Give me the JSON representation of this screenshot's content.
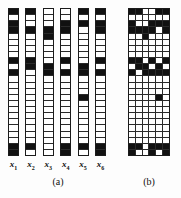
{
  "figure": {
    "panel_a": {
      "caption": "(a)",
      "vectors": [
        {
          "label": "x",
          "subscript": "1",
          "bits": [
            1,
            0,
            1,
            1,
            0,
            0,
            0,
            0,
            1,
            0,
            1,
            0,
            0,
            0,
            0,
            0,
            0,
            0,
            0,
            0,
            0,
            0,
            1,
            1
          ]
        },
        {
          "label": "x",
          "subscript": "2",
          "bits": [
            1,
            0,
            0,
            1,
            0,
            0,
            0,
            0,
            1,
            1,
            0,
            0,
            0,
            0,
            0,
            0,
            0,
            0,
            0,
            0,
            0,
            0,
            1,
            0
          ]
        },
        {
          "label": "x",
          "subscript": "3",
          "bits": [
            0,
            0,
            0,
            1,
            1,
            0,
            0,
            0,
            0,
            1,
            1,
            0,
            0,
            0,
            0,
            0,
            0,
            0,
            0,
            0,
            0,
            0,
            0,
            0
          ]
        },
        {
          "label": "x",
          "subscript": "4",
          "bits": [
            0,
            0,
            1,
            1,
            0,
            0,
            0,
            0,
            1,
            0,
            1,
            0,
            0,
            0,
            0,
            0,
            0,
            0,
            0,
            0,
            0,
            0,
            1,
            1
          ]
        },
        {
          "label": "x",
          "subscript": "5",
          "bits": [
            1,
            0,
            1,
            0,
            0,
            0,
            0,
            0,
            0,
            1,
            1,
            0,
            0,
            0,
            1,
            0,
            0,
            0,
            0,
            0,
            0,
            0,
            1,
            0
          ]
        },
        {
          "label": "x",
          "subscript": "6",
          "bits": [
            1,
            0,
            1,
            1,
            0,
            0,
            0,
            0,
            1,
            0,
            1,
            0,
            0,
            0,
            0,
            0,
            0,
            0,
            0,
            0,
            0,
            0,
            1,
            1
          ]
        }
      ]
    },
    "panel_b": {
      "caption": "(b)",
      "columns": [
        {
          "bits": [
            1,
            0,
            1,
            1,
            0,
            0,
            0,
            0,
            1,
            0,
            1,
            0,
            0,
            0,
            0,
            0,
            0,
            0,
            0,
            0,
            0,
            0,
            1,
            1
          ]
        },
        {
          "bits": [
            1,
            0,
            0,
            1,
            0,
            0,
            0,
            0,
            1,
            1,
            0,
            0,
            0,
            0,
            0,
            0,
            0,
            0,
            0,
            0,
            0,
            0,
            1,
            0
          ]
        },
        {
          "bits": [
            0,
            0,
            0,
            1,
            1,
            0,
            0,
            0,
            0,
            1,
            1,
            0,
            0,
            0,
            0,
            0,
            0,
            0,
            0,
            0,
            0,
            0,
            0,
            0
          ]
        },
        {
          "bits": [
            0,
            0,
            1,
            1,
            0,
            0,
            0,
            0,
            1,
            0,
            1,
            0,
            0,
            0,
            0,
            0,
            0,
            0,
            0,
            0,
            0,
            0,
            1,
            1
          ]
        },
        {
          "bits": [
            1,
            0,
            1,
            0,
            0,
            0,
            0,
            0,
            0,
            1,
            1,
            0,
            0,
            0,
            1,
            0,
            0,
            0,
            0,
            0,
            0,
            0,
            1,
            0
          ]
        },
        {
          "bits": [
            1,
            0,
            1,
            1,
            0,
            0,
            0,
            0,
            1,
            0,
            1,
            0,
            0,
            0,
            0,
            0,
            0,
            0,
            0,
            0,
            0,
            0,
            1,
            1
          ]
        }
      ]
    },
    "colors": {
      "bit_on": "#111111",
      "bit_off": "#ffffff",
      "grid_line": "#2a2a2a",
      "border": "#1b1b1b",
      "background": "#fdfdfd"
    },
    "geometry": {
      "rows": 24,
      "panel_a_columns": 6,
      "panel_b_columns": 6
    }
  }
}
